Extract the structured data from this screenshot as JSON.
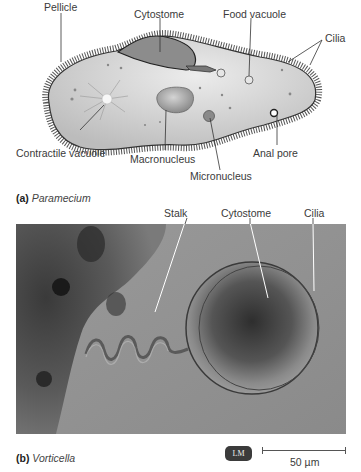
{
  "figure_a": {
    "labels": {
      "pellicle": "Pellicle",
      "cytostome": "Cytostome",
      "food_vacuole": "Food vacuole",
      "cilia": "Cilia",
      "contractile_vacuole": "Contractile vacuole",
      "macronucleus": "Macronucleus",
      "micronucleus": "Micronucleus",
      "anal_pore": "Anal pore"
    },
    "caption_letter": "(a)",
    "caption_name": "Paramecium"
  },
  "figure_b": {
    "labels": {
      "stalk": "Stalk",
      "cytostome": "Cytostome",
      "cilia": "Cilia"
    },
    "caption_letter": "(b)",
    "caption_name": "Vorticella",
    "badge": "LM",
    "scale_bar": "50 µm"
  },
  "colors": {
    "cell_fill": "#d6d6d6",
    "photo_bg": "#8e8e8e",
    "badge_bg": "#3b3b3b"
  }
}
